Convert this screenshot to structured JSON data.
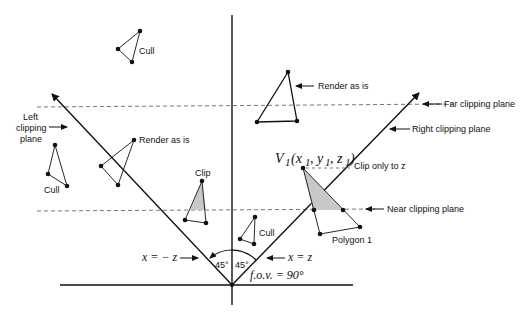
{
  "diagram": {
    "type": "view-frustum-clipping",
    "labels": {
      "cull_top": "Cull",
      "cull_left": "Cull",
      "cull_center": "Cull",
      "render_left": "Render as is",
      "render_top": "Render as is",
      "clip": "Clip",
      "clip_only_z": "Clip only to z",
      "polygon1": "Polygon 1",
      "left_plane_1": "Left",
      "left_plane_2": "clipping",
      "left_plane_3": "plane",
      "far_plane": "Far clipping plane",
      "right_plane": "Right clipping plane",
      "near_plane": "Near clipping plane",
      "x_neg_z": "x = − z",
      "x_z": "x = z",
      "angle_left": "45°",
      "angle_right": "45°",
      "fov": "f.o.v. = 90°",
      "vertex_name": "V",
      "vertex_sub": "1",
      "vertex_coords": "(x",
      "vertex_coords_y": ", y",
      "vertex_coords_z": ", z",
      "vertex_close": ")"
    },
    "colors": {
      "line": "#111111",
      "dash": "#555555",
      "fill_clip": "#c8c8c8"
    }
  }
}
